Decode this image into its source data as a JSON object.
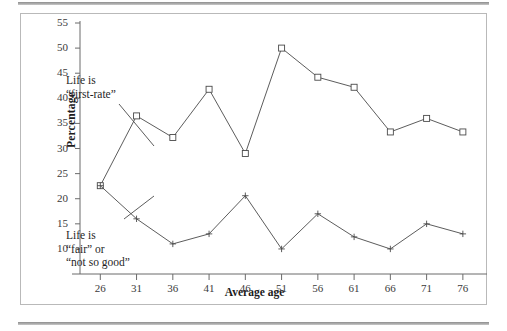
{
  "figure": {
    "rule_top": "horizontal-rule",
    "rule_bottom": "horizontal-rule"
  },
  "chart_data": {
    "type": "line",
    "title": "",
    "subtitle": "",
    "xlabel": "Average age",
    "ylabel": "Percentage",
    "x": [
      26,
      31,
      36,
      41,
      46,
      51,
      56,
      61,
      66,
      71,
      76
    ],
    "categories": [
      "26",
      "31",
      "36",
      "41",
      "46",
      "51",
      "56",
      "61",
      "66",
      "71",
      "76"
    ],
    "xticklabels": [
      "26",
      "31",
      "36",
      "41",
      "46",
      "51",
      "56",
      "61",
      "66",
      "71",
      "76"
    ],
    "yticklabels": [
      "10",
      "15",
      "20",
      "25",
      "30",
      "35",
      "40",
      "45",
      "50",
      "55"
    ],
    "yticks": [
      10,
      15,
      20,
      25,
      30,
      35,
      40,
      45,
      50,
      55
    ],
    "ylim": [
      7,
      55
    ],
    "xlim": [
      23.2,
      78.5
    ],
    "grid": false,
    "legend": "none",
    "series": [
      {
        "name": "Life is “first-rate”",
        "marker": "square",
        "color": "#4a4a4a",
        "values": [
          22.6,
          36.5,
          32.2,
          41.8,
          29.0,
          50.0,
          44.2,
          42.2,
          33.3,
          36.0,
          33.3
        ]
      },
      {
        "name": "Life is “fair” or “not so good”",
        "marker": "plus",
        "color": "#4a4a4a",
        "values": [
          22.6,
          16.0,
          11.0,
          13.0,
          20.6,
          10.0,
          17.0,
          12.4,
          10.0,
          15.0,
          13.0
        ]
      }
    ],
    "annotations": [
      {
        "id": "upper",
        "lines": [
          "Life is",
          "“first-rate”"
        ],
        "leader_from": [
          98,
          90
        ],
        "leader_to": [
          133,
          132
        ]
      },
      {
        "id": "lower",
        "lines": [
          "Life is",
          "“fair” or",
          "“not so good”"
        ],
        "leader_from": [
          103,
          205
        ],
        "leader_to": [
          133,
          182
        ]
      }
    ]
  }
}
